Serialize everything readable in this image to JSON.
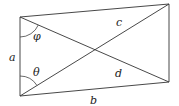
{
  "diagram": {
    "type": "quadrilateral-with-diagonals",
    "vertices": {
      "top_left": [
        20,
        17
      ],
      "bottom_left": [
        20,
        96
      ],
      "top_right": [
        169,
        4
      ],
      "bottom_right": [
        169,
        82
      ]
    },
    "labels": {
      "side_left": "a",
      "side_bottom": "b",
      "diagonal_upper": "c",
      "diagonal_lower": "d",
      "angle_top": "φ",
      "angle_bottom": "θ"
    },
    "colors": {
      "stroke": "#333333",
      "text": "#222222",
      "background": "#ffffff"
    }
  }
}
